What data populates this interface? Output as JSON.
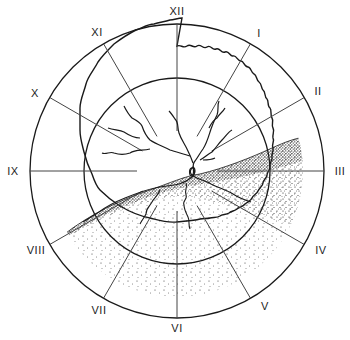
{
  "diagram": {
    "center": [
      177,
      171
    ],
    "outer_radius": 147,
    "wavy_radius": 124,
    "inner_radius": 93,
    "radial_inner_radius": 40,
    "line_color": "#1a1a1a",
    "stipple_color": "#1a1a1a",
    "background": "#ffffff"
  },
  "clock_labels": [
    {
      "text": "XII",
      "x": 177,
      "y": 11
    },
    {
      "text": "I",
      "x": 259,
      "y": 33
    },
    {
      "text": "II",
      "x": 318,
      "y": 91
    },
    {
      "text": "III",
      "x": 340,
      "y": 171
    },
    {
      "text": "IV",
      "x": 321,
      "y": 250
    },
    {
      "text": "V",
      "x": 265,
      "y": 306
    },
    {
      "text": "VI",
      "x": 177,
      "y": 328
    },
    {
      "text": "VII",
      "x": 99,
      "y": 310
    },
    {
      "text": "VIII",
      "x": 36,
      "y": 250
    },
    {
      "text": "IX",
      "x": 13,
      "y": 171
    },
    {
      "text": "X",
      "x": 35,
      "y": 93
    },
    {
      "text": "XI",
      "x": 97,
      "y": 32
    }
  ]
}
